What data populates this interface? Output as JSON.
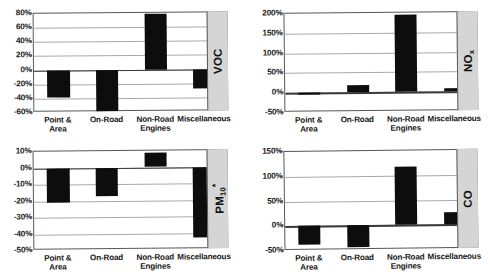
{
  "figure": {
    "categories": [
      "Point &\nArea",
      "On-Road",
      "Non-Road\nEngines",
      "Miscellaneous"
    ],
    "bar_color": "#0d0d0d",
    "side_panel_color": "#d5d5d5",
    "gridline_color": "#a8a8aa"
  },
  "chart_data": [
    {
      "type": "bar",
      "title": "VOC",
      "pollutant_label": "VOC",
      "categories": [
        "Point & Area",
        "On-Road",
        "Non-Road Engines",
        "Miscellaneous"
      ],
      "values": [
        -39,
        -58,
        78,
        -28
      ],
      "ylabel": "",
      "xlabel": "",
      "ylim": [
        -60,
        80
      ],
      "ticks": [
        80,
        60,
        40,
        20,
        0,
        -20,
        -40,
        -60
      ],
      "tick_labels": [
        "80%",
        "60%",
        "40%",
        "20%",
        "0%",
        "-20%",
        "-40%",
        "-60%"
      ],
      "grid": true,
      "legend": "none"
    },
    {
      "type": "bar",
      "title": "NOx",
      "pollutant_label": "NO",
      "pollutant_sub": "x",
      "categories": [
        "Point & Area",
        "On-Road",
        "Non-Road Engines",
        "Miscellaneous"
      ],
      "values": [
        -5,
        18,
        195,
        8
      ],
      "ylabel": "",
      "xlabel": "",
      "ylim": [
        -50,
        200
      ],
      "ticks": [
        200,
        150,
        100,
        50,
        0,
        -50
      ],
      "tick_labels": [
        "200%",
        "150%",
        "100%",
        "50%",
        "0%",
        "-50%"
      ],
      "grid": true,
      "legend": "none"
    },
    {
      "type": "bar",
      "title": "PM10*",
      "pollutant_label": "PM",
      "pollutant_sub": "10",
      "pollutant_asterisk": "*",
      "categories": [
        "Point & Area",
        "On-Road",
        "Non-Road Engines",
        "Miscellaneous"
      ],
      "values": [
        -21,
        -17,
        9,
        -43
      ],
      "ylabel": "",
      "xlabel": "",
      "ylim": [
        -50,
        10
      ],
      "ticks": [
        10,
        0,
        -10,
        -20,
        -30,
        -40,
        -50
      ],
      "tick_labels": [
        "10%",
        "0%",
        "-10%",
        "-20%",
        "-30%",
        "-40%",
        "-50%"
      ],
      "grid": true,
      "legend": "none"
    },
    {
      "type": "bar",
      "title": "CO",
      "pollutant_label": "CO",
      "categories": [
        "Point & Area",
        "On-Road",
        "Non-Road Engines",
        "Miscellaneous"
      ],
      "values": [
        -37,
        -43,
        118,
        25
      ],
      "ylabel": "",
      "xlabel": "",
      "ylim": [
        -50,
        150
      ],
      "ticks": [
        150,
        100,
        50,
        0,
        -50
      ],
      "tick_labels": [
        "150%",
        "100%",
        "50%",
        "0%",
        "-50%"
      ],
      "grid": true,
      "legend": "none"
    }
  ]
}
